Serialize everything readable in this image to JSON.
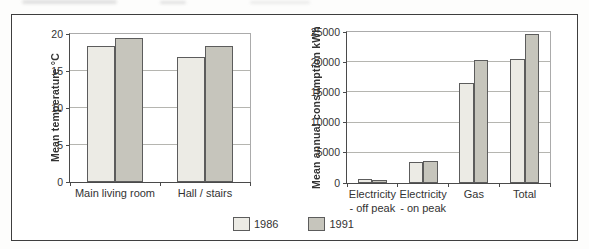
{
  "figure": {
    "type": "scanned-figure",
    "background": "#ffffff",
    "border_color": "#3e3e3e"
  },
  "legend": {
    "position": "bottom-center",
    "items": [
      {
        "label": "1986",
        "color": "#ECEBE5"
      },
      {
        "label": "1991",
        "color": "#C6C5BC"
      }
    ]
  },
  "colors": {
    "gridline": "#b5b5b0",
    "axis": "#4a4a4a",
    "bar_border": "#5c5c5c",
    "text": "#333333"
  },
  "chart_data": [
    {
      "type": "bar",
      "title": "",
      "xlabel": "",
      "ylabel": "Mean temperature °C",
      "ylim": [
        0,
        20
      ],
      "yticks": [
        0,
        5,
        10,
        15,
        20
      ],
      "ytick_labels": [
        "0",
        "5",
        "10",
        "15",
        "20"
      ],
      "grid": true,
      "categories": [
        "Main living room",
        "Hall / stairs"
      ],
      "series": [
        {
          "name": "1986",
          "color": "#ECEBE5",
          "values": [
            18.4,
            16.9
          ]
        },
        {
          "name": "1991",
          "color": "#C6C5BC",
          "values": [
            19.4,
            18.4
          ]
        }
      ],
      "bar_width_pct": 15.5
    },
    {
      "type": "bar",
      "title": "",
      "xlabel": "",
      "ylabel": "Mean annual consumption kWh",
      "ylim": [
        0,
        25000
      ],
      "yticks": [
        0,
        5000,
        10000,
        15000,
        20000,
        25000
      ],
      "ytick_labels": [
        "0",
        "5000",
        "10000",
        "15000",
        "20000",
        "25000"
      ],
      "grid": true,
      "categories": [
        "Electricity\n- off peak",
        "Electricity\n- on peak",
        "Gas",
        "Total"
      ],
      "series": [
        {
          "name": "1986",
          "color": "#ECEBE5",
          "values": [
            600,
            3400,
            16500,
            20600
          ]
        },
        {
          "name": "1991",
          "color": "#C6C5BC",
          "values": [
            550,
            3600,
            20400,
            24600
          ]
        }
      ],
      "bar_width_pct": 7.2
    }
  ]
}
